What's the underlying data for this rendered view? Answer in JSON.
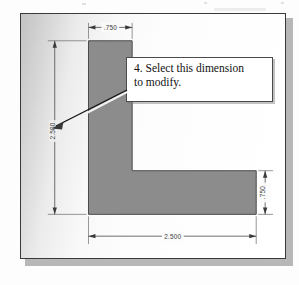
{
  "figure": {
    "kind": "cad-dimension-drawing",
    "part_name": "L-shaped-bracket",
    "frame": {
      "border_color": "#3a3a3a",
      "shadow_color": "#b7b7b7"
    },
    "part_fill_color": "#8c8c8c",
    "part_edge_color": "#4a4a4a"
  },
  "dimensions": [
    {
      "id": "top-width",
      "label": ".750",
      "orientation": "horizontal",
      "position": "top"
    },
    {
      "id": "overall-height",
      "label": "2.500",
      "orientation": "vertical",
      "position": "left"
    },
    {
      "id": "base-thickness",
      "label": ".750",
      "orientation": "vertical",
      "position": "right"
    },
    {
      "id": "overall-width",
      "label": "2.500",
      "orientation": "horizontal",
      "position": "bottom"
    }
  ],
  "callout": {
    "step_number": "4.",
    "text": "4. Select this dimension to modify.",
    "line1": "4. Select this dimension",
    "line2": "to modify.",
    "points_to": "overall-height",
    "border_color": "#4a4a4a",
    "background_color": "#ffffff"
  }
}
